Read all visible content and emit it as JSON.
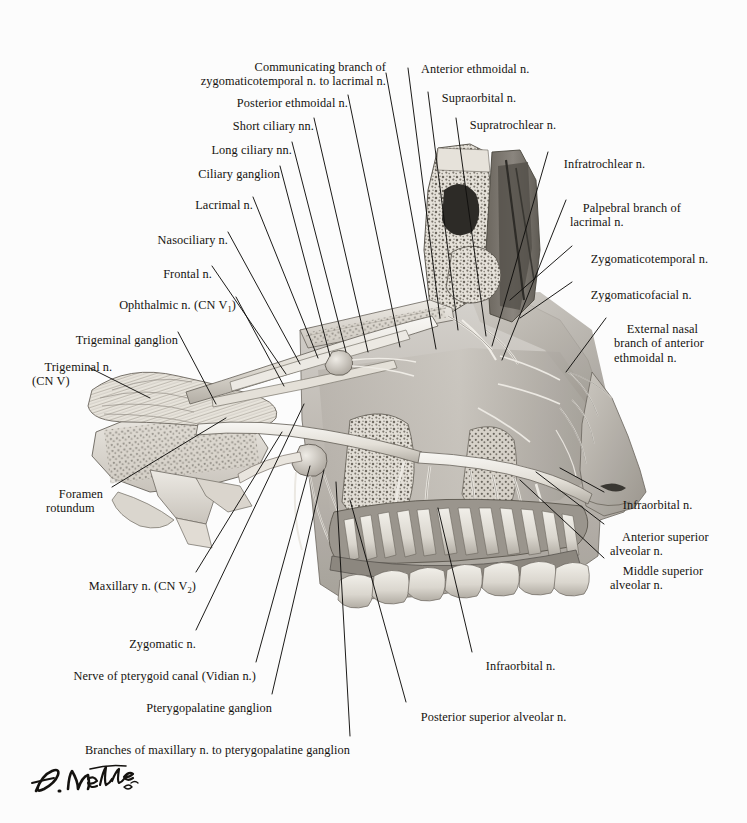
{
  "figure": {
    "signature": "F. Netter M.D.",
    "background_color": "#ffffff",
    "ink_color": "#100f0d",
    "artwork_tone": "grayscale-halftone"
  },
  "labels": [
    {
      "id": "communicating-branch",
      "text": "Communicating branch of\nzygomaticotemporal n. to lacrimal n."
    },
    {
      "id": "posterior-ethmoidal",
      "text": "Posterior ethmoidal n."
    },
    {
      "id": "short-ciliary",
      "text": "Short ciliary nn."
    },
    {
      "id": "long-ciliary",
      "text": "Long ciliary nn."
    },
    {
      "id": "ciliary-ganglion",
      "text": "Ciliary ganglion"
    },
    {
      "id": "lacrimal",
      "text": "Lacrimal n."
    },
    {
      "id": "nasociliary",
      "text": "Nasociliary n."
    },
    {
      "id": "frontal",
      "text": "Frontal n."
    },
    {
      "id": "ophthalmic",
      "text": "Ophthalmic n. (CN V",
      "subscript": "1",
      "suffix": ")"
    },
    {
      "id": "trigeminal-ganglion",
      "text": "Trigeminal ganglion"
    },
    {
      "id": "trigeminal",
      "text": "Trigeminal n.\n(CN V)"
    },
    {
      "id": "foramen-rotundum",
      "text": "Foramen\nrotundum"
    },
    {
      "id": "maxillary",
      "text": "Maxillary n. (CN V",
      "subscript": "2",
      "suffix": ")"
    },
    {
      "id": "zygomatic",
      "text": "Zygomatic n."
    },
    {
      "id": "nerve-pterygoid-canal",
      "text": "Nerve of pterygoid canal (Vidian n.)"
    },
    {
      "id": "pterygopalatine-ganglion",
      "text": "Pterygopalatine ganglion"
    },
    {
      "id": "branches-maxillary",
      "text": "Branches of maxillary n. to pterygopalatine ganglion"
    },
    {
      "id": "posterior-sup-alveolar",
      "text": "Posterior superior alveolar n."
    },
    {
      "id": "infraorbital-lower",
      "text": "Infraorbital n."
    },
    {
      "id": "anterior-ethmoidal",
      "text": "Anterior ethmoidal n."
    },
    {
      "id": "supraorbital",
      "text": "Supraorbital n."
    },
    {
      "id": "supratrochlear",
      "text": "Supratrochlear n."
    },
    {
      "id": "infratrochlear",
      "text": "Infratrochlear n."
    },
    {
      "id": "palpebral-branch",
      "text": "Palpebral branch of\nlacrimal n."
    },
    {
      "id": "zygomaticotemporal",
      "text": "Zygomaticotemporal n."
    },
    {
      "id": "zygomaticofacial",
      "text": "Zygomaticofacial n."
    },
    {
      "id": "external-nasal",
      "text": "External nasal\nbranch of anterior\nethmoidal n."
    },
    {
      "id": "infraorbital-right",
      "text": "Infraorbital n."
    },
    {
      "id": "anterior-sup-alveolar",
      "text": "Anterior superior\nalveolar n."
    },
    {
      "id": "middle-sup-alveolar",
      "text": "Middle superior\nalveolar n."
    }
  ]
}
